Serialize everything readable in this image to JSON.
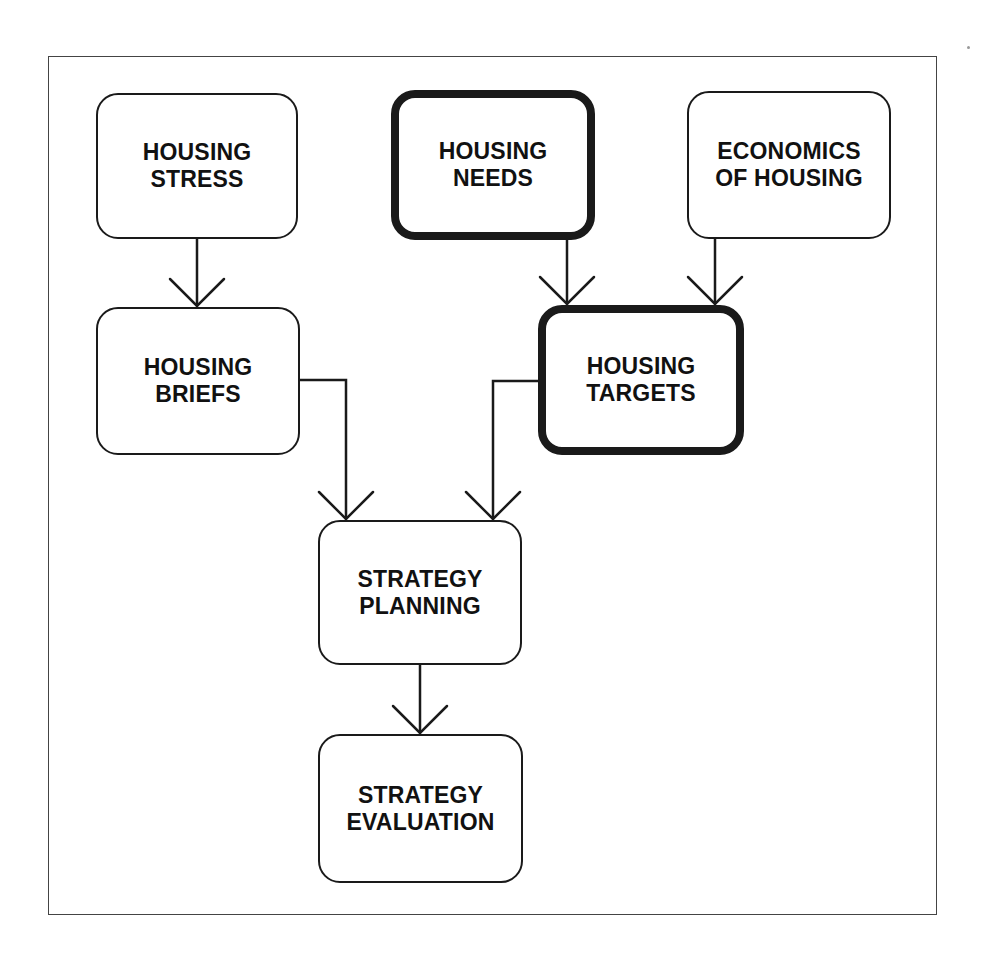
{
  "diagram": {
    "nodes": [
      {
        "id": "housing_stress",
        "label": "HOUSING\nSTRESS",
        "emphasis": false
      },
      {
        "id": "housing_needs",
        "label": "HOUSING\nNEEDS",
        "emphasis": true
      },
      {
        "id": "economics_of_housing",
        "label": "ECONOMICS\nOF HOUSING",
        "emphasis": false
      },
      {
        "id": "housing_briefs",
        "label": "HOUSING\nBRIEFS",
        "emphasis": false
      },
      {
        "id": "housing_targets",
        "label": "HOUSING\nTARGETS",
        "emphasis": true
      },
      {
        "id": "strategy_planning",
        "label": "STRATEGY\nPLANNING",
        "emphasis": false
      },
      {
        "id": "strategy_evaluation",
        "label": "STRATEGY\nEVALUATION",
        "emphasis": false
      }
    ],
    "edges": [
      {
        "from": "housing_stress",
        "to": "housing_briefs"
      },
      {
        "from": "housing_needs",
        "to": "housing_targets"
      },
      {
        "from": "economics_of_housing",
        "to": "housing_targets"
      },
      {
        "from": "housing_briefs",
        "to": "strategy_planning"
      },
      {
        "from": "housing_targets",
        "to": "strategy_planning"
      },
      {
        "from": "strategy_planning",
        "to": "strategy_evaluation"
      }
    ],
    "colors": {
      "stroke": "#1a1a1a",
      "background": "#ffffff"
    }
  }
}
